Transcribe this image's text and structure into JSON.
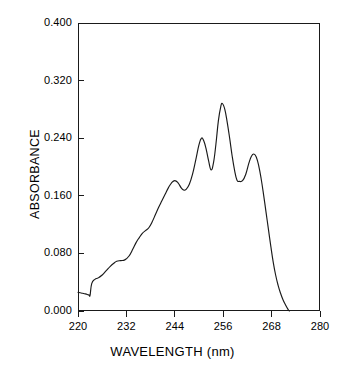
{
  "chart_data": {
    "type": "line",
    "title": "",
    "xlabel": "WAVELENGTH (nm)",
    "ylabel": "ABSORBANCE",
    "xlim": [
      220,
      280
    ],
    "ylim": [
      0.0,
      0.4
    ],
    "grid": false,
    "legend": null,
    "x_ticks": [
      220,
      232,
      244,
      256,
      268,
      280
    ],
    "x_tick_labels": [
      "220",
      "232",
      "244",
      "256",
      "268",
      "280"
    ],
    "y_ticks": [
      0.0,
      0.08,
      0.16,
      0.24,
      0.32,
      0.4
    ],
    "y_tick_labels": [
      "0.000",
      "0.080",
      "0.160",
      "0.240",
      "0.320",
      "0.400"
    ],
    "line_color": "#1a1a1a",
    "series": [
      {
        "name": "absorbance",
        "x": [
          220.0,
          220.8,
          221.6,
          222.3,
          222.8,
          223.0,
          223.4,
          224.2,
          225.0,
          226.0,
          227.0,
          228.0,
          228.8,
          229.6,
          230.6,
          231.6,
          232.6,
          233.6,
          234.4,
          235.2,
          236.0,
          236.8,
          237.6,
          238.4,
          239.2,
          240.0,
          240.8,
          241.6,
          242.4,
          243.2,
          244.0,
          244.8,
          245.6,
          246.2,
          246.8,
          247.6,
          248.4,
          249.2,
          250.0,
          250.6,
          251.2,
          251.8,
          252.4,
          253.0,
          253.6,
          254.2,
          254.8,
          255.4,
          255.8,
          256.4,
          257.0,
          257.6,
          258.2,
          258.8,
          259.4,
          260.0,
          260.8,
          261.6,
          262.4,
          263.0,
          263.6,
          264.2,
          264.8,
          265.4,
          266.0,
          266.6,
          267.2,
          267.8,
          268.4,
          269.0,
          269.6,
          270.2,
          270.8,
          271.4,
          272.0,
          272.4
        ],
        "y": [
          0.026,
          0.025,
          0.024,
          0.023,
          0.022,
          0.022,
          0.038,
          0.044,
          0.046,
          0.05,
          0.056,
          0.062,
          0.066,
          0.069,
          0.07,
          0.071,
          0.076,
          0.086,
          0.095,
          0.102,
          0.108,
          0.112,
          0.116,
          0.124,
          0.134,
          0.144,
          0.153,
          0.162,
          0.171,
          0.178,
          0.181,
          0.178,
          0.171,
          0.168,
          0.169,
          0.176,
          0.19,
          0.21,
          0.231,
          0.24,
          0.236,
          0.224,
          0.208,
          0.196,
          0.206,
          0.232,
          0.264,
          0.284,
          0.288,
          0.28,
          0.262,
          0.24,
          0.216,
          0.196,
          0.182,
          0.18,
          0.181,
          0.19,
          0.206,
          0.215,
          0.218,
          0.214,
          0.202,
          0.184,
          0.162,
          0.138,
          0.114,
          0.09,
          0.068,
          0.05,
          0.036,
          0.025,
          0.016,
          0.009,
          0.003,
          0.0
        ]
      }
    ]
  },
  "axes": {
    "y_title": "ABSORBANCE",
    "x_title": "WAVELENGTH (nm)"
  }
}
